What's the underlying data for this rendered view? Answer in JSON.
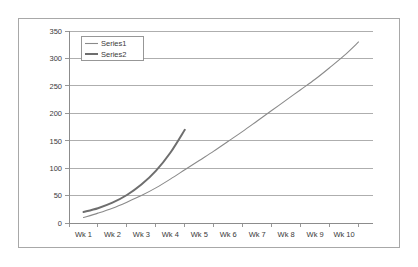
{
  "chart_data": {
    "type": "line",
    "title": "",
    "xlabel": "",
    "ylabel": "",
    "grid": "horizontal",
    "legend_position": "top-left-inside",
    "categories": [
      "Wk 1",
      "Wk 2",
      "Wk 3",
      "Wk 4",
      "Wk 5",
      "Wk 6",
      "Wk 7",
      "Wk 8",
      "Wk 9",
      "Wk 10"
    ],
    "ylim": [
      0,
      350
    ],
    "yticks": [
      0,
      50,
      100,
      150,
      200,
      250,
      300,
      350
    ],
    "ytick_labels": [
      "0",
      "50",
      "100",
      "150",
      "200",
      "250",
      "300",
      "350"
    ],
    "xlim": [
      0.5,
      11.0
    ],
    "series": [
      {
        "name": "Series1",
        "color": "#8a8a8a",
        "x": [
          1.0,
          1.5,
          2.0,
          2.5,
          3.0,
          3.5,
          4.0,
          4.5,
          5.0,
          5.5,
          6.0,
          6.5,
          7.0,
          7.5,
          8.0,
          8.5,
          9.0,
          9.5,
          10.0,
          10.5
        ],
        "values": [
          10,
          18,
          27,
          38,
          50,
          64,
          80,
          97,
          114,
          131,
          149,
          167,
          186,
          205,
          224,
          243,
          262,
          283,
          305,
          330
        ]
      },
      {
        "name": "Series2",
        "color": "#6e6e6e",
        "x": [
          1.0,
          1.5,
          2.0,
          2.5,
          3.0,
          3.5,
          4.0,
          4.5
        ],
        "values": [
          20,
          27,
          37,
          51,
          70,
          95,
          128,
          170
        ]
      }
    ]
  },
  "legend": {
    "entries": [
      {
        "label": "Series1"
      },
      {
        "label": "Series2"
      }
    ]
  },
  "colors": {
    "series1": "#8a8a8a",
    "series2": "#6e6e6e",
    "gridline": "#9a9a9a",
    "axis": "#8c8c8c",
    "frame_border": "#a8a8a8",
    "text": "#3a3a3a",
    "background": "#ffffff"
  }
}
